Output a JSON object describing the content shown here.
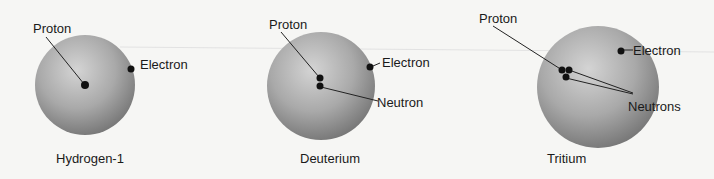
{
  "diagram": {
    "atoms": [
      {
        "name": "Hydrogen-1",
        "labels": {
          "proton": "Proton",
          "electron": "Electron"
        }
      },
      {
        "name": "Deuterium",
        "labels": {
          "proton": "Proton",
          "electron": "Electron",
          "neutron": "Neutron"
        }
      },
      {
        "name": "Tritium",
        "labels": {
          "proton": "Proton",
          "electron": "Electron",
          "neutrons": "Neutrons"
        }
      }
    ],
    "colors": {
      "sphere_light": "#d2d2d2",
      "sphere_dark": "#7a7a7a",
      "particle": "#111111",
      "background": "#f6f6f4"
    }
  }
}
